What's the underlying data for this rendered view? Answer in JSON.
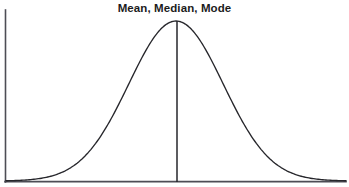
{
  "figure": {
    "title": "Mean, Median, Mode",
    "background_color": "#ffffff",
    "width": 349,
    "height": 187
  },
  "style": {
    "axis_color": "#4d4d55",
    "curve_color": "#26262b",
    "center_line_color": "#26262b",
    "title_color": "#1c1c1c"
  },
  "axes": {
    "y_axis": {
      "x": 5,
      "y_top": 10,
      "y_bottom": 182
    },
    "x_axis": {
      "y": 182,
      "x_left": 5,
      "x_right": 346
    },
    "x_tick_labels": [],
    "y_tick_labels": [],
    "grid": false
  },
  "annotations": {
    "center_line": {
      "label": "Mean, Median, Mode",
      "x": 177,
      "y_top": 21,
      "y_bottom": 182
    }
  },
  "chart_data": {
    "type": "line",
    "title": "Mean, Median, Mode",
    "subtitle": "",
    "xlabel": "",
    "ylabel": "",
    "grid": false,
    "legend": [],
    "legend_position": "none",
    "annotations": [
      {
        "text": "Mean, Median, Mode",
        "type": "vertical-line-at-center",
        "x": 0.0
      }
    ],
    "distribution": {
      "name": "normal",
      "mean": 0.0,
      "std_dev": 1.0
    },
    "xlim": [
      -3.6,
      3.6
    ],
    "ylim": [
      0,
      1.0
    ],
    "x": [
      -3.6,
      -3.2,
      -2.8,
      -2.4,
      -2.0,
      -1.6,
      -1.2,
      -0.8,
      -0.4,
      0.0,
      0.4,
      0.8,
      1.2,
      1.6,
      2.0,
      2.4,
      2.8,
      3.2,
      3.6
    ],
    "series": [
      {
        "name": "Normal density",
        "values": [
          0.002,
          0.006,
          0.019,
          0.056,
          0.135,
          0.278,
          0.487,
          0.726,
          0.923,
          1.0,
          0.923,
          0.726,
          0.487,
          0.278,
          0.135,
          0.056,
          0.019,
          0.006,
          0.002
        ]
      }
    ],
    "pixel_path": {
      "peak": [
        177,
        21
      ],
      "left_tail_end": [
        6,
        181
      ],
      "right_tail_end": [
        346,
        181
      ],
      "left_inflection": [
        111,
        101
      ],
      "right_inflection": [
        243,
        101
      ]
    }
  }
}
